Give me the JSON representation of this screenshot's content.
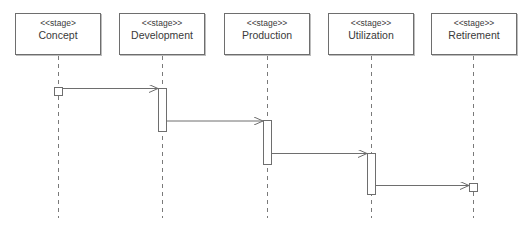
{
  "diagram": {
    "type": "uml-sequence-diagram",
    "stages": [
      {
        "stereotype": "<<stage>",
        "name": "Concept"
      },
      {
        "stereotype": "<<stage>>",
        "name": "Development"
      },
      {
        "stereotype": "<<stage>>",
        "name": "Production"
      },
      {
        "stereotype": "<<stage>>",
        "name": "Utilization"
      },
      {
        "stereotype": "<<stage>>",
        "name": "Retirement"
      }
    ],
    "messages": [
      {
        "from": "Concept",
        "to": "Development"
      },
      {
        "from": "Development",
        "to": "Production"
      },
      {
        "from": "Production",
        "to": "Utilization"
      },
      {
        "from": "Utilization",
        "to": "Retirement"
      }
    ],
    "colors": {
      "line": "#6e6e6e",
      "text": "#3a3a3a",
      "background": "#ffffff"
    }
  }
}
